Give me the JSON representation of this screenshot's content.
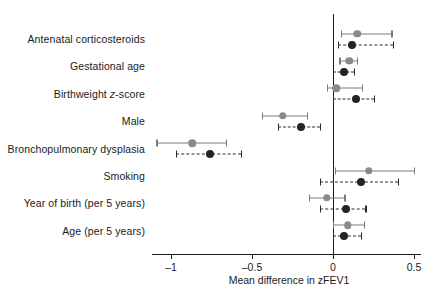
{
  "chart_data": {
    "type": "scatter",
    "subtype": "forest-plot",
    "title": "",
    "xlabel": "Mean difference in zFEV1",
    "ylabel": "",
    "xlim": [
      -1.15,
      0.62
    ],
    "xticks": [
      -1,
      -0.5,
      0,
      0.5
    ],
    "xtick_labels": [
      "–1",
      "–0.5",
      "0",
      "0.5"
    ],
    "grid": false,
    "reference_line": 0,
    "legend_position": "none",
    "categories": [
      "Antenatal corticosteroids",
      "Gestational age",
      "Birthweight z-score",
      "Male",
      "Bronchopulmonary dysplasia",
      "Smoking",
      "Year of birth (per 5 years)",
      "Age (per 5 years)"
    ],
    "series": [
      {
        "name": "gray",
        "marker": "circle-gray",
        "line_style": "solid",
        "color": "#8a8a8a",
        "estimates": [
          0.15,
          0.1,
          0.02,
          -0.31,
          -0.87,
          0.22,
          -0.04,
          0.09
        ],
        "ci_low": [
          0.05,
          0.04,
          -0.04,
          -0.44,
          -1.09,
          0.01,
          -0.15,
          0.0
        ],
        "ci_high": [
          0.36,
          0.15,
          0.18,
          -0.16,
          -0.66,
          0.5,
          0.07,
          0.19
        ]
      },
      {
        "name": "black",
        "marker": "circle-black",
        "line_style": "dashed",
        "color": "#232323",
        "estimates": [
          0.12,
          0.07,
          0.14,
          -0.2,
          -0.76,
          0.17,
          0.08,
          0.07
        ],
        "ci_low": [
          0.03,
          0.0,
          0.0,
          -0.34,
          -0.97,
          -0.08,
          -0.08,
          0.0
        ],
        "ci_high": [
          0.37,
          0.13,
          0.25,
          -0.08,
          -0.57,
          0.4,
          0.2,
          0.17
        ]
      }
    ]
  },
  "axis": {
    "x_title": "Mean difference in zFEV1",
    "tick_labels": [
      "–1",
      "–0.5",
      "0",
      "0.5"
    ]
  },
  "labels": {
    "rows": [
      {
        "text": "Antenatal corticosteroids",
        "pre": "Antenatal corticosteroids",
        "ital": "",
        "post": ""
      },
      {
        "text": "Gestational age",
        "pre": "Gestational age",
        "ital": "",
        "post": ""
      },
      {
        "text": "Birthweight z-score",
        "pre": "Birthweight ",
        "ital": "z",
        "post": "-score"
      },
      {
        "text": "Male",
        "pre": "Male",
        "ital": "",
        "post": ""
      },
      {
        "text": "Bronchopulmonary dysplasia",
        "pre": "Bronchopulmonary dysplasia",
        "ital": "",
        "post": ""
      },
      {
        "text": "Smoking",
        "pre": "Smoking",
        "ital": "",
        "post": ""
      },
      {
        "text": "Year of birth (per 5 years)",
        "pre": "Year of birth (per 5 years)",
        "ital": "",
        "post": ""
      },
      {
        "text": "Age (per 5 years)",
        "pre": "Age (per 5 years)",
        "ital": "",
        "post": ""
      }
    ]
  },
  "colors": {
    "gray_series": "#8a8a8a",
    "black_series": "#232323",
    "axis": "#1a1a1a",
    "background": "#ffffff"
  }
}
